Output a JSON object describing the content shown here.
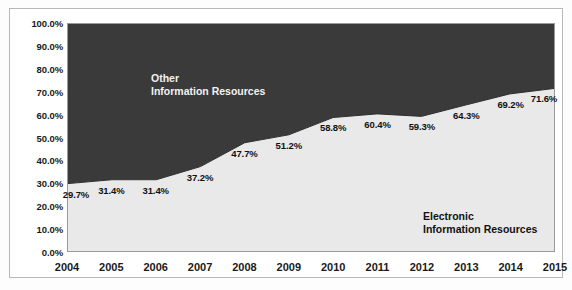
{
  "chart_data": {
    "type": "area",
    "stacked": true,
    "title": "",
    "subtitle": "",
    "xlabel": "",
    "ylabel": "",
    "categories": [
      "2004",
      "2005",
      "2006",
      "2007",
      "2008",
      "2009",
      "2010",
      "2011",
      "2012",
      "2013",
      "2014",
      "2015"
    ],
    "ylim": [
      0,
      100
    ],
    "ytick_labels": [
      "0.0%",
      "10.0%",
      "20.0%",
      "30.0%",
      "40.0%",
      "50.0%",
      "60.0%",
      "70.0%",
      "80.0%",
      "90.0%",
      "100.0%"
    ],
    "ytick_values": [
      0,
      10,
      20,
      30,
      40,
      50,
      60,
      70,
      80,
      90,
      100
    ],
    "grid": false,
    "legend_position": "inside-plot-annotations",
    "series": [
      {
        "name": "Electronic Information Resources",
        "color": "#e9e9e9",
        "values": [
          29.7,
          31.4,
          31.4,
          37.2,
          47.7,
          51.2,
          58.8,
          60.4,
          59.3,
          64.3,
          69.2,
          71.6
        ],
        "data_labels": [
          "29.7%",
          "31.4%",
          "31.4%",
          "37.2%",
          "47.7%",
          "51.2%",
          "58.8%",
          "60.4%",
          "59.3%",
          "64.3%",
          "69.2%",
          "71.6%"
        ]
      },
      {
        "name": "Other Information Resources",
        "color": "#3a3a3a",
        "values": [
          70.3,
          68.6,
          68.6,
          62.8,
          52.3,
          48.8,
          41.2,
          39.6,
          40.7,
          35.7,
          30.8,
          28.4
        ],
        "data_labels": []
      }
    ],
    "annotations": [
      {
        "id": "other",
        "text": "Other\nInformation Resources",
        "color": "#f2f2f2"
      },
      {
        "id": "electronic",
        "text": "Electronic\nInformation Resources",
        "color": "#111111"
      }
    ]
  },
  "colors": {
    "dark_series": "#3a3a3a",
    "light_series": "#e9e9e9",
    "plot_border": "#9a9a9a",
    "frame_border": "#b8b8b8",
    "page_background": "#fdfdfd",
    "axis_text": "#1a1a1a"
  },
  "annotation_other": "Other\nInformation Resources",
  "annotation_electronic": "Electronic\nInformation Resources"
}
